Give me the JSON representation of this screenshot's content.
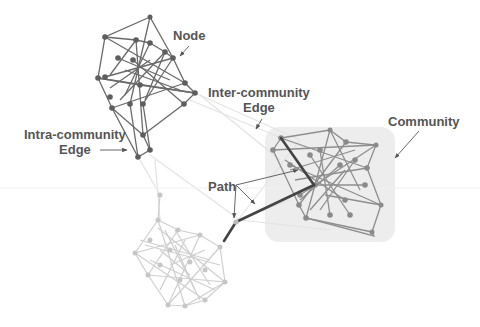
{
  "figure": {
    "labels": {
      "node": "Node",
      "inter_community_edge_line1": "Inter-community",
      "inter_community_edge_line2": "Edge",
      "community": "Community",
      "intra_community_edge_line1": "Intra-community",
      "intra_community_edge_line2": "Edge",
      "path": "Path"
    },
    "colors": {
      "background": "#ffffff",
      "community_top": "#6a6a6a",
      "community_right": "#8c8c8c",
      "community_bottom": "#c8c8c8",
      "community_box": "#ececec",
      "path": "#444444",
      "inter_edge": "#e2e2e2",
      "label_text": "#555555"
    },
    "communities": [
      {
        "name": "top-left",
        "shade": "dark"
      },
      {
        "name": "right",
        "shade": "medium",
        "highlighted": true
      },
      {
        "name": "bottom",
        "shade": "light"
      }
    ]
  }
}
